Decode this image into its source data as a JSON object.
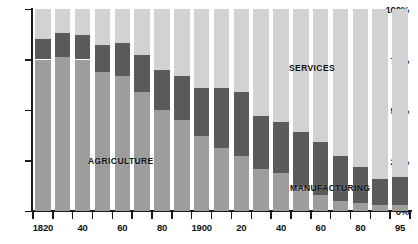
{
  "chart_data": {
    "type": "bar",
    "subtype": "stacked-percent",
    "title": "",
    "xlabel": "",
    "ylabel": "",
    "ylim": [
      0,
      100
    ],
    "grid": false,
    "legend_position": "inline-annotations",
    "categories": [
      "1820",
      "1830",
      "1840",
      "1850",
      "1860",
      "1870",
      "1880",
      "1890",
      "1900",
      "1910",
      "1920",
      "1930",
      "1940",
      "1950",
      "1960",
      "1970",
      "1980",
      "1990",
      "1995"
    ],
    "x_tick_labels": [
      "1820",
      "40",
      "60",
      "80",
      "1900",
      "20",
      "40",
      "60",
      "80",
      "95"
    ],
    "x_tick_label_categories": [
      "1820",
      "1840",
      "1860",
      "1880",
      "1900",
      "1920",
      "1940",
      "1960",
      "1980",
      "1995"
    ],
    "y_tick_labels": [
      "0%",
      "25%",
      "50%",
      "75%",
      "100%"
    ],
    "y_tick_values": [
      0,
      25,
      50,
      75,
      100
    ],
    "series": [
      {
        "name": "AGRICULTURE",
        "color": "#9d9d9d",
        "values": [
          75,
          76,
          75,
          69,
          67,
          59,
          50,
          45,
          37,
          31,
          27,
          21,
          19,
          12,
          8,
          5,
          4,
          3,
          3
        ]
      },
      {
        "name": "MANUFACTURING",
        "color": "#5a5a5a",
        "values": [
          10,
          12,
          12,
          13,
          16,
          18,
          20,
          22,
          24,
          30,
          32,
          26,
          25,
          27,
          26,
          22,
          18,
          13,
          14
        ]
      },
      {
        "name": "SERVICES",
        "color": "#d2d2d2",
        "values": [
          15,
          12,
          13,
          18,
          17,
          23,
          30,
          33,
          39,
          39,
          41,
          53,
          56,
          61,
          66,
          73,
          78,
          84,
          83
        ]
      }
    ],
    "annotations": [
      {
        "text": "AGRICULTURE",
        "series": "AGRICULTURE"
      },
      {
        "text": "SERVICES",
        "series": "SERVICES"
      },
      {
        "text": "MANUFACTURING",
        "series": "MANUFACTURING"
      }
    ],
    "colors": {
      "agriculture": "#9d9d9d",
      "manufacturing": "#5a5a5a",
      "services": "#d2d2d2",
      "axis": "#1a1a1a",
      "background": "#ffffff"
    }
  }
}
